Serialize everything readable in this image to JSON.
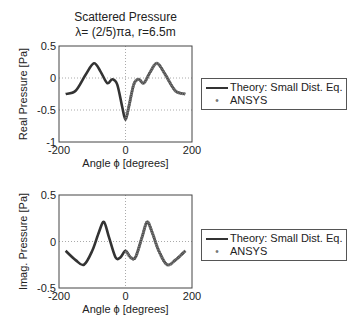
{
  "figure": {
    "title_line1": "Scattered Pressure",
    "title_line2": "λ= (2/5)πa, r=6.5m"
  },
  "chart_data": [
    {
      "type": "line",
      "title": "Scattered Pressure λ= (2/5)πa, r=6.5m",
      "xlabel": "Angle ϕ [degrees]",
      "ylabel": "Real Pressure [Pa]",
      "xlim": [
        -200,
        200
      ],
      "ylim": [
        -1,
        0.5
      ],
      "xticks": [
        "-200",
        "0",
        "200"
      ],
      "yticks": [
        "0.5",
        "0",
        "-0.5",
        "-1"
      ],
      "grid": "dotted at 0",
      "legend": [
        "Theory: Small Dist. Eq.",
        "ANSYS"
      ],
      "legend_position": "outside right",
      "series": [
        {
          "name": "Theory: Small Dist. Eq.",
          "style": "line",
          "color": "#333333",
          "x": [
            -180,
            -150,
            -120,
            -95,
            -75,
            -55,
            -40,
            -25,
            -10,
            0,
            10,
            25,
            40,
            55,
            75,
            95,
            120,
            150,
            180
          ],
          "values": [
            -0.25,
            -0.2,
            0.05,
            0.23,
            0.1,
            -0.08,
            -0.02,
            -0.1,
            -0.45,
            -0.65,
            -0.45,
            -0.1,
            -0.02,
            -0.08,
            0.1,
            0.23,
            0.05,
            -0.2,
            -0.25
          ]
        },
        {
          "name": "ANSYS",
          "style": "markers",
          "color": "#777777",
          "x": [
            0,
            10,
            25,
            40,
            55,
            75,
            95,
            120,
            150,
            180
          ],
          "values": [
            -0.65,
            -0.45,
            -0.1,
            -0.02,
            -0.08,
            0.1,
            0.23,
            0.05,
            -0.2,
            -0.25
          ]
        }
      ]
    },
    {
      "type": "line",
      "xlabel": "Angle ϕ [degrees]",
      "ylabel": "Imag. Pressure [Pa]",
      "xlim": [
        -200,
        200
      ],
      "ylim": [
        -0.5,
        0.5
      ],
      "xticks": [
        "-200",
        "0",
        "200"
      ],
      "yticks": [
        "0.5",
        "0",
        "-0.5"
      ],
      "grid": "dotted at 0",
      "legend": [
        "Theory: Small Dist. Eq.",
        "ANSYS"
      ],
      "legend_position": "outside right",
      "series": [
        {
          "name": "Theory: Small Dist. Eq.",
          "style": "line",
          "color": "#333333",
          "x": [
            -180,
            -150,
            -125,
            -100,
            -80,
            -65,
            -50,
            -30,
            -15,
            0,
            15,
            30,
            50,
            65,
            80,
            100,
            125,
            150,
            180
          ],
          "values": [
            -0.1,
            -0.2,
            -0.25,
            -0.1,
            0.1,
            0.21,
            0.05,
            -0.17,
            -0.17,
            -0.1,
            -0.17,
            -0.17,
            0.05,
            0.21,
            0.1,
            -0.1,
            -0.25,
            -0.2,
            -0.1
          ]
        },
        {
          "name": "ANSYS",
          "style": "markers",
          "color": "#777777",
          "x": [
            0,
            15,
            30,
            50,
            65,
            80,
            100,
            125,
            150,
            180
          ],
          "values": [
            -0.1,
            -0.17,
            -0.17,
            0.05,
            0.21,
            0.1,
            -0.1,
            -0.25,
            -0.2,
            -0.1
          ]
        }
      ]
    }
  ]
}
